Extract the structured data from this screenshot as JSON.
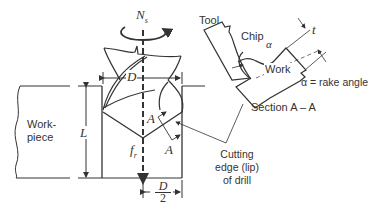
{
  "figure": {
    "labels": {
      "spindle_speed": "N",
      "spindle_speed_sub": "s",
      "diameter": "D",
      "half_diameter_num": "D",
      "half_diameter_den": "2",
      "length": "L",
      "feed": "f",
      "feed_sub": "r",
      "section_marker_top": "A",
      "section_marker_bottom": "A",
      "workpiece_line1": "Work-",
      "workpiece_line2": "piece",
      "cutting_edge_line1": "Cutting",
      "cutting_edge_line2": "edge (lip)",
      "cutting_edge_line3": "of drill",
      "tool": "Tool",
      "chip": "Chip",
      "alpha": "α",
      "thickness": "t",
      "work": "Work",
      "rake_legend": "α = rake angle",
      "section_title": "Section A – A"
    },
    "colors": {
      "line": "#333333",
      "background": "#ffffff"
    }
  }
}
